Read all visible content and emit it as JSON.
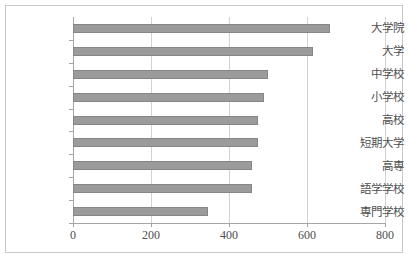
{
  "chart_data": {
    "type": "bar",
    "orientation": "horizontal",
    "title": "",
    "xlabel": "",
    "ylabel": "",
    "xlim": [
      0,
      800
    ],
    "ylim": null,
    "grid": true,
    "legend": null,
    "bar_color": "#9b9b9b",
    "bar_border_color": "#868686",
    "axis_color": "#a6a6a6",
    "grid_color": "#d2d2d2",
    "frame_color": "#c8c8c8",
    "xticks": [
      0,
      200,
      400,
      600,
      800
    ],
    "xtick_labels": [
      "0",
      "200",
      "400",
      "600",
      "800"
    ],
    "categories": [
      "大学院",
      "大学",
      "中学校",
      "小学校",
      "高校",
      "短期大学",
      "高専",
      "語学学校",
      "専門学校"
    ],
    "values": [
      660,
      615,
      500,
      490,
      475,
      475,
      458,
      458,
      345
    ]
  }
}
